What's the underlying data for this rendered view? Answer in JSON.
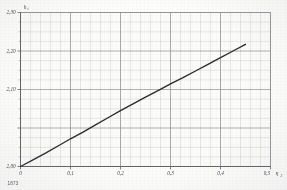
{
  "figure": {
    "caption": "1873",
    "background_color": "#fdfdfb",
    "curve_color": "#2b2b30",
    "grid_minor_color": "#c9c9cf",
    "grid_major_color": "#8e8e97",
    "axis_color": "#6e6e77"
  },
  "chart_data": {
    "type": "line",
    "title": "",
    "xlabel": "η",
    "xlabel_sub": "2",
    "ylabel": "h",
    "ylabel_sub": "t",
    "xlim": [
      0,
      0.5
    ],
    "ylim": [
      2.0,
      2.3
    ],
    "grid": true,
    "grid_minor_x_step": 0.02,
    "grid_minor_y_step": 0.0125,
    "legend": "none",
    "xticks": [
      0,
      0.1,
      0.2,
      0.3,
      0.4,
      0.5
    ],
    "xticklabels": [
      "0",
      "0,1",
      "0,2",
      "0,3",
      "0,4",
      "0,5"
    ],
    "yticks": [
      2.0,
      2.1,
      2.2,
      2.3
    ],
    "yticklabels": [
      "2,00",
      "2,10",
      "2,20",
      "2,30"
    ],
    "x": [
      0.0,
      0.025,
      0.05,
      0.075,
      0.1,
      0.125,
      0.15,
      0.175,
      0.2,
      0.225,
      0.25,
      0.275,
      0.3,
      0.325,
      0.35,
      0.375,
      0.4,
      0.425,
      0.45
    ],
    "y": [
      2.0,
      2.013,
      2.026,
      2.04,
      2.054,
      2.067,
      2.081,
      2.095,
      2.109,
      2.122,
      2.135,
      2.148,
      2.161,
      2.173,
      2.186,
      2.199,
      2.212,
      2.225,
      2.238
    ],
    "series": [
      {
        "name": "curve",
        "values": [
          2.0,
          2.013,
          2.026,
          2.04,
          2.054,
          2.067,
          2.081,
          2.095,
          2.109,
          2.122,
          2.135,
          2.148,
          2.161,
          2.173,
          2.186,
          2.199,
          2.212,
          2.225,
          2.238
        ]
      }
    ]
  }
}
